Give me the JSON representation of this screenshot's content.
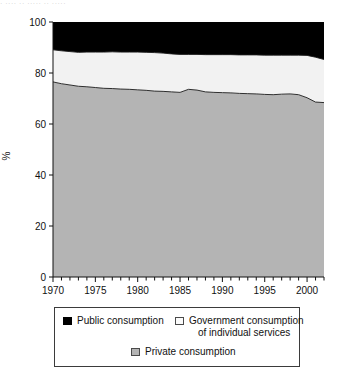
{
  "artifact": {
    "text": "·  ····  ·· ····· ··  ·····"
  },
  "legend": {
    "items": [
      {
        "label": "Public consumption",
        "swatch": "black-square-icon",
        "color": "#000000"
      },
      {
        "label_line1": "Government consumption",
        "label_line2": "of individual services",
        "swatch": "white-square-icon",
        "color": "#f2f2f2"
      },
      {
        "label": "Private consumption",
        "swatch": "gray-square-icon",
        "color": "#b4b4b4"
      }
    ]
  },
  "chart_data": {
    "type": "area",
    "stacked": true,
    "normalized": true,
    "title": "",
    "xlabel": "",
    "ylabel": "%",
    "ylim": [
      0,
      100
    ],
    "yticks": [
      0,
      20,
      40,
      60,
      80,
      100
    ],
    "xlim": [
      1970,
      2002
    ],
    "xticks": [
      1970,
      1975,
      1980,
      1985,
      1990,
      1995,
      2000
    ],
    "minor_xticks_every": 1,
    "grid": false,
    "legend_position": "below",
    "x": [
      1970,
      1971,
      1972,
      1973,
      1974,
      1975,
      1976,
      1977,
      1978,
      1979,
      1980,
      1981,
      1982,
      1983,
      1984,
      1985,
      1986,
      1987,
      1988,
      1989,
      1990,
      1991,
      1992,
      1993,
      1994,
      1995,
      1996,
      1997,
      1998,
      1999,
      2000,
      2001,
      2002
    ],
    "series": [
      {
        "name": "Private consumption",
        "color": "#b4b4b4",
        "values": [
          76.5,
          75.8,
          75.3,
          74.8,
          74.6,
          74.3,
          74.0,
          73.9,
          73.7,
          73.6,
          73.4,
          73.2,
          72.9,
          72.8,
          72.6,
          72.4,
          73.6,
          73.3,
          72.6,
          72.4,
          72.3,
          72.2,
          72.0,
          71.9,
          71.8,
          71.6,
          71.5,
          71.7,
          71.8,
          71.5,
          70.3,
          68.6,
          68.4
        ]
      },
      {
        "name": "Government consumption of individual services",
        "color": "#f2f2f2",
        "values": [
          12.6,
          12.9,
          13.1,
          13.3,
          13.6,
          13.9,
          14.2,
          14.4,
          14.5,
          14.6,
          14.8,
          14.9,
          15.1,
          15.0,
          14.9,
          14.9,
          13.7,
          14.0,
          14.6,
          14.8,
          14.9,
          15.0,
          15.1,
          15.2,
          15.3,
          15.4,
          15.5,
          15.3,
          15.2,
          15.5,
          16.6,
          17.6,
          16.9
        ]
      },
      {
        "name": "Public consumption",
        "color": "#000000",
        "values": [
          10.9,
          11.3,
          11.6,
          11.9,
          11.8,
          11.8,
          11.8,
          11.7,
          11.8,
          11.8,
          11.8,
          11.9,
          12.0,
          12.2,
          12.5,
          12.7,
          12.7,
          12.7,
          12.8,
          12.8,
          12.8,
          12.8,
          12.9,
          12.9,
          12.9,
          13.0,
          13.0,
          13.0,
          13.0,
          13.0,
          13.1,
          13.8,
          14.7
        ]
      }
    ]
  }
}
